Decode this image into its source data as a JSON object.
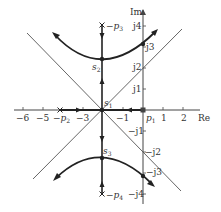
{
  "diagram": {
    "type": "root-locus",
    "axes": {
      "real_label": "Re",
      "imag_label": "Im",
      "real_ticks": [
        {
          "value": -6,
          "label": "−6"
        },
        {
          "value": -5,
          "label": "−5"
        },
        {
          "value": -3,
          "label": "−3"
        },
        {
          "value": -1,
          "label": "−1"
        },
        {
          "value": 1,
          "label": "1"
        },
        {
          "value": 2,
          "label": "2"
        }
      ],
      "imag_ticks": [
        {
          "value": 4,
          "label": "j4"
        },
        {
          "value": 3,
          "label": "j3"
        },
        {
          "value": 2,
          "label": "j2"
        },
        {
          "value": 1,
          "label": "j1"
        },
        {
          "value": -1,
          "label": "−j1"
        },
        {
          "value": -2,
          "label": "−j2"
        },
        {
          "value": -3,
          "label": "−j3"
        },
        {
          "value": -4,
          "label": "−j4"
        }
      ]
    },
    "poles": [
      {
        "name": "p1",
        "label": "p",
        "sub": "1",
        "prefix": "",
        "re": 0,
        "im": 0,
        "marker": "square"
      },
      {
        "name": "p2",
        "label": "p",
        "sub": "2",
        "prefix": "−",
        "re": -4,
        "im": 0,
        "marker": "cross"
      },
      {
        "name": "p3",
        "label": "p",
        "sub": "3",
        "prefix": "−",
        "re": -2,
        "im": 4,
        "marker": "cross"
      },
      {
        "name": "p4",
        "label": "p",
        "sub": "4",
        "prefix": "−",
        "re": -2,
        "im": -4,
        "marker": "cross"
      }
    ],
    "points": [
      {
        "name": "s1",
        "label": "s",
        "sub": "1",
        "re": -2,
        "im": 0
      },
      {
        "name": "s2",
        "label": "s",
        "sub": "2",
        "re": -2,
        "im": 2.4
      },
      {
        "name": "s3",
        "label": "s",
        "sub": "3",
        "re": -2,
        "im": -2.4
      }
    ],
    "asymptotes": {
      "centroid": -2,
      "angles_deg": [
        45,
        135,
        225,
        315
      ]
    },
    "crossings": [
      {
        "re": 0,
        "im": 3.1
      },
      {
        "re": 0,
        "im": -3.1
      }
    ],
    "colors": {
      "locus": "#222222",
      "asymptote": "#555555",
      "axis": "#444444",
      "text": "#333333"
    }
  }
}
